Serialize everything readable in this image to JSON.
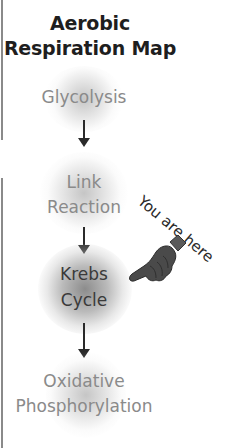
{
  "title": {
    "line1": "Aerobic",
    "line2": "Respiration Map"
  },
  "stages": [
    {
      "lines": [
        "Glycolysis"
      ],
      "current": false
    },
    {
      "lines": [
        "Link",
        "Reaction"
      ],
      "current": false
    },
    {
      "lines": [
        "Krebs",
        "Cycle"
      ],
      "current": true
    },
    {
      "lines": [
        "Oxidative",
        "Phosphorylation"
      ],
      "current": false
    }
  ],
  "marker": {
    "text": "You are here",
    "icon": "pointing-hand-icon",
    "points_to": "Krebs Cycle"
  },
  "colors": {
    "title": "#1e1e1e",
    "stage_text": "#8a8a8a",
    "current_stage_text": "#3a3a3a",
    "arrow": "#2a2a2a",
    "hand": "#4a4a4a"
  }
}
